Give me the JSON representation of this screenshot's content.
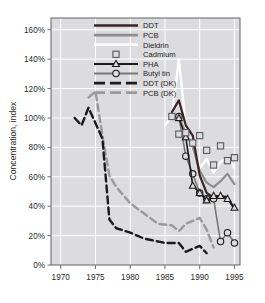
{
  "chart_data": {
    "type": "line",
    "title": "",
    "xlabel": "",
    "ylabel": "Concentration, index",
    "xlim": [
      1968.6,
      1995.8
    ],
    "ylim": [
      0,
      168
    ],
    "xticks": [
      1970,
      1975,
      1980,
      1985,
      1990,
      1995
    ],
    "xtick_labels": [
      "1970",
      "1975",
      "1980",
      "1985",
      "1990",
      "1995"
    ],
    "yticks": [
      0,
      20,
      40,
      60,
      80,
      100,
      120,
      140,
      160
    ],
    "ytick_labels": [
      "0%",
      "20%",
      "40%",
      "60%",
      "80%",
      "100%",
      "120%",
      "140%",
      "160%"
    ],
    "grid": "horizontal-and-vertical-white-on-gray",
    "legend_position": "top-center-inside",
    "plot_background": "#dcdcde",
    "series": [
      {
        "name": "DDT",
        "style": "solid-line",
        "color": "#3b2326",
        "marker": "none",
        "x": [
          1986,
          1987,
          1988,
          1989,
          1990,
          1991,
          1992,
          1993,
          1994,
          1995
        ],
        "y": [
          104,
          112,
          95,
          88,
          61,
          49,
          46,
          47,
          46,
          38
        ]
      },
      {
        "name": "PCB",
        "style": "solid-line",
        "color": "#8e8e90",
        "marker": "none",
        "x": [
          1986,
          1987,
          1988,
          1989,
          1990,
          1991,
          1992,
          1993,
          1994,
          1995
        ],
        "y": [
          101,
          100,
          90,
          80,
          64,
          56,
          53,
          57,
          62,
          55
        ]
      },
      {
        "name": "Dieldrin",
        "style": "solid-line",
        "color": "#fdfdfd",
        "marker": "none",
        "x": [
          1985,
          1986,
          1987,
          1988,
          1989,
          1990,
          1991,
          1992,
          1993,
          1994,
          1995
        ],
        "y": [
          95,
          101,
          140,
          95,
          78,
          66,
          72,
          63,
          70,
          73,
          66
        ]
      },
      {
        "name": "Cadmium",
        "style": "markers-only",
        "color": "#5a5a5c",
        "marker": "square-open",
        "x": [
          1986,
          1987,
          1988,
          1989,
          1990,
          1991,
          1992,
          1993,
          1994,
          1995
        ],
        "y": [
          101,
          89,
          90,
          83,
          88,
          78,
          68,
          81,
          71,
          73
        ]
      },
      {
        "name": "PHA",
        "style": "solid-line-with-markers",
        "color": "#1b1b1b",
        "marker": "triangle-open",
        "x": [
          1987,
          1988,
          1989,
          1990,
          1991,
          1992,
          1993,
          1994,
          1995
        ],
        "y": [
          100,
          87,
          54,
          49,
          44,
          47,
          47,
          45,
          39
        ]
      },
      {
        "name": "Butyl tin",
        "style": "solid-line-with-markers",
        "color": "#787878",
        "marker": "circle-open",
        "x": [
          1987,
          1988,
          1989,
          1990,
          1991,
          1992,
          1993,
          1994,
          1995
        ],
        "y": [
          101,
          74,
          62,
          49,
          45,
          45,
          16,
          22,
          15
        ]
      },
      {
        "name": "DDT (DK)",
        "style": "dashed-line",
        "color": "#1b1b1b",
        "marker": "none",
        "x": [
          1972,
          1973,
          1974,
          1976,
          1977,
          1978,
          1980,
          1982,
          1983,
          1985,
          1987,
          1988,
          1989,
          1990,
          1991
        ],
        "y": [
          100,
          95,
          107,
          86,
          31,
          25,
          22,
          18,
          17,
          15,
          15,
          9,
          11,
          13,
          8
        ]
      },
      {
        "name": "PCB (DK)",
        "style": "dashed-line",
        "color": "#9a9a9c",
        "marker": "none",
        "x": [
          1974,
          1975,
          1976,
          1977,
          1978,
          1980,
          1982,
          1984,
          1986,
          1987,
          1988,
          1990,
          1991,
          1992
        ],
        "y": [
          114,
          118,
          88,
          61,
          53,
          42,
          35,
          28,
          27,
          23,
          28,
          32,
          24,
          12
        ]
      }
    ]
  },
  "legend": {
    "entries": [
      {
        "label": "DDT",
        "key": "ddt"
      },
      {
        "label": "PCB",
        "key": "pcb"
      },
      {
        "label": "Dieldrin",
        "key": "dieldrin"
      },
      {
        "label": "Cadmium",
        "key": "cadmium"
      },
      {
        "label": "PHA",
        "key": "pha"
      },
      {
        "label": "Butyl tin",
        "key": "butyl-tin"
      },
      {
        "label": "DDT (DK)",
        "key": "ddt-dk"
      },
      {
        "label": "PCB (DK)",
        "key": "pcb-dk"
      }
    ]
  }
}
